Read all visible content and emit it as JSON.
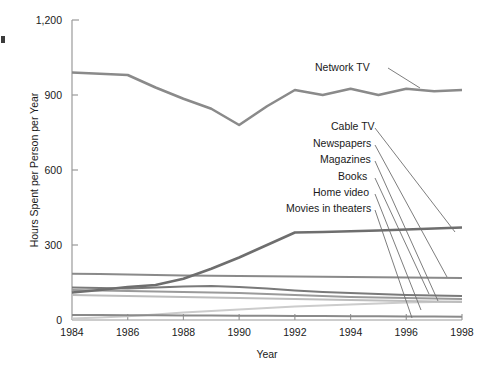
{
  "chart_data": {
    "type": "line",
    "title": "",
    "xlabel": "Year",
    "ylabel": "Hours Spent per Person per Year",
    "xlim": [
      1984,
      1998
    ],
    "ylim": [
      0,
      1200
    ],
    "xticks": [
      "1984",
      "1986",
      "1988",
      "1990",
      "1992",
      "1994",
      "1996",
      "1998"
    ],
    "xtick_values": [
      1984,
      1986,
      1988,
      1990,
      1992,
      1994,
      1996,
      1998
    ],
    "yticks": [
      "0",
      "300",
      "600",
      "900",
      "1,200"
    ],
    "ytick_values": [
      0,
      300,
      600,
      900,
      1200
    ],
    "grid": false,
    "legend_position": "inline-annotations",
    "x": [
      1984,
      1985,
      1986,
      1987,
      1988,
      1989,
      1990,
      1991,
      1992,
      1993,
      1994,
      1995,
      1996,
      1997,
      1998
    ],
    "series": [
      {
        "name": "Network TV",
        "color": "#8a8a8a",
        "width": 2.6,
        "values": [
          990,
          985,
          980,
          930,
          885,
          845,
          780,
          855,
          920,
          900,
          925,
          900,
          925,
          915,
          920
        ]
      },
      {
        "name": "Cable TV",
        "color": "#6e6e6e",
        "width": 2.6,
        "values": [
          110,
          120,
          132,
          140,
          165,
          205,
          250,
          300,
          350,
          352,
          355,
          358,
          362,
          366,
          370
        ]
      },
      {
        "name": "Newspapers",
        "color": "#8a8a8a",
        "width": 2.2,
        "values": [
          185,
          184,
          182,
          180,
          178,
          177,
          176,
          175,
          174,
          173,
          172,
          171,
          170,
          169,
          168
        ]
      },
      {
        "name": "Magazines",
        "color": "#7a7a7a",
        "width": 2.2,
        "values": [
          130,
          128,
          126,
          130,
          134,
          136,
          132,
          126,
          118,
          112,
          108,
          104,
          100,
          98,
          96
        ]
      },
      {
        "name": "Books",
        "color": "#9a9a9a",
        "width": 2.2,
        "values": [
          120,
          118,
          116,
          114,
          112,
          110,
          108,
          104,
          100,
          96,
          92,
          90,
          88,
          86,
          84
        ]
      },
      {
        "name": "Home video",
        "color": "#bdbdbd",
        "width": 2.2,
        "values": [
          100,
          98,
          96,
          94,
          92,
          90,
          88,
          86,
          84,
          82,
          80,
          78,
          76,
          74,
          72
        ]
      },
      {
        "name": "Movies in theaters",
        "color": "#8a8a8a",
        "width": 2.2,
        "values": [
          20,
          20,
          19,
          19,
          18,
          18,
          17,
          17,
          16,
          16,
          15,
          15,
          14,
          14,
          13
        ]
      },
      {
        "name": "Baseline series",
        "color": "#cccccc",
        "width": 2.0,
        "values": [
          6,
          10,
          15,
          22,
          30,
          36,
          42,
          48,
          54,
          58,
          62,
          66,
          70,
          72,
          74
        ]
      }
    ],
    "annotations": [
      {
        "label": "Network TV",
        "text_x": 315,
        "text_y": 71,
        "anchor": "start",
        "leader": [
          [
            388,
            68
          ],
          [
            420,
            88
          ]
        ]
      },
      {
        "label": "Cable TV",
        "text_x": 331,
        "text_y": 130,
        "anchor": "start",
        "leader": [
          [
            375,
            128
          ],
          [
            455,
            232
          ]
        ]
      },
      {
        "label": "Newspapers",
        "text_x": 313,
        "text_y": 147,
        "anchor": "start",
        "leader": [
          [
            375,
            145
          ],
          [
            447,
            277
          ]
        ]
      },
      {
        "label": "Magazines",
        "text_x": 320,
        "text_y": 163,
        "anchor": "start",
        "leader": [
          [
            375,
            161
          ],
          [
            438,
            301
          ]
        ]
      },
      {
        "label": "Books",
        "text_x": 338,
        "text_y": 180,
        "anchor": "start",
        "leader": [
          [
            375,
            178
          ],
          [
            429,
            294
          ]
        ]
      },
      {
        "label": "Home video",
        "text_x": 313,
        "text_y": 196,
        "anchor": "start",
        "leader": [
          [
            375,
            194
          ],
          [
            421,
            310
          ]
        ]
      },
      {
        "label": "Movies in theaters",
        "text_x": 286,
        "text_y": 212,
        "anchor": "start",
        "leader": [
          [
            375,
            210
          ],
          [
            412,
            318
          ]
        ]
      }
    ]
  }
}
